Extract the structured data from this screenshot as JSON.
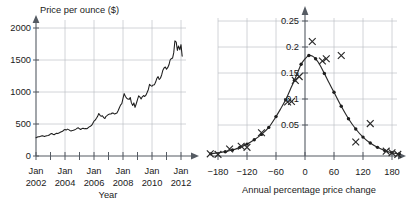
{
  "figure": {
    "panels": [
      "gold-price-time-series",
      "annual-change-distribution"
    ]
  },
  "left_chart": {
    "ylabel": "Price per ounce ($)",
    "xlabel": "Year",
    "y_ticks": [
      "0",
      "500",
      "1000",
      "1500",
      "2000"
    ],
    "x_ticks": [
      "Jan\n2002",
      "Jan\n2004",
      "Jan\n2006",
      "Jan\n2008",
      "Jan\n2010",
      "Jan\n2012"
    ],
    "x_tick_month": "Jan",
    "x_tick_years": [
      "2002",
      "2004",
      "2006",
      "2008",
      "2010",
      "2012"
    ]
  },
  "right_chart": {
    "xlabel": "Annual percentage price change",
    "y_ticks": [
      "0.05",
      "0.1",
      "0.15",
      "0.2",
      "0.25"
    ],
    "x_ticks": [
      "−180",
      "−120",
      "−60",
      "0",
      "60",
      "120",
      "180"
    ]
  },
  "chart_data": [
    {
      "type": "line",
      "id": "gold-price-time-series",
      "title": "",
      "xlabel": "Year",
      "ylabel": "Price per ounce ($)",
      "xlim": [
        2002.0,
        2012.25
      ],
      "ylim": [
        0,
        2100
      ],
      "ytick_values": [
        0,
        500,
        1000,
        1500,
        2000
      ],
      "ytick_labels": [
        "0",
        "500",
        "1000",
        "1500",
        "2000"
      ],
      "xtick_values": [
        2002,
        2004,
        2006,
        2008,
        2010,
        2012
      ],
      "xtick_labels": [
        "Jan 2002",
        "Jan 2004",
        "Jan 2006",
        "Jan 2008",
        "Jan 2010",
        "Jan 2012"
      ],
      "minor_xtick_values": [
        2003,
        2005,
        2007,
        2009,
        2011
      ],
      "grid": "both-major",
      "legend": "none",
      "series": [
        {
          "name": "Gold price per ounce (USD)",
          "x": [
            2002.0,
            2002.08,
            2002.17,
            2002.25,
            2002.33,
            2002.42,
            2002.5,
            2002.58,
            2002.67,
            2002.75,
            2002.83,
            2002.92,
            2003.0,
            2003.08,
            2003.17,
            2003.25,
            2003.33,
            2003.42,
            2003.5,
            2003.58,
            2003.67,
            2003.75,
            2003.83,
            2003.92,
            2004.0,
            2004.08,
            2004.17,
            2004.25,
            2004.33,
            2004.42,
            2004.5,
            2004.58,
            2004.67,
            2004.75,
            2004.83,
            2004.92,
            2005.0,
            2005.08,
            2005.17,
            2005.25,
            2005.33,
            2005.42,
            2005.5,
            2005.58,
            2005.67,
            2005.75,
            2005.83,
            2005.92,
            2006.0,
            2006.08,
            2006.17,
            2006.25,
            2006.33,
            2006.42,
            2006.5,
            2006.58,
            2006.67,
            2006.75,
            2006.83,
            2006.92,
            2007.0,
            2007.08,
            2007.17,
            2007.25,
            2007.33,
            2007.42,
            2007.5,
            2007.58,
            2007.67,
            2007.75,
            2007.83,
            2007.92,
            2008.0,
            2008.08,
            2008.17,
            2008.25,
            2008.33,
            2008.42,
            2008.5,
            2008.58,
            2008.67,
            2008.75,
            2008.83,
            2008.92,
            2009.0,
            2009.08,
            2009.17,
            2009.25,
            2009.33,
            2009.42,
            2009.5,
            2009.58,
            2009.67,
            2009.75,
            2009.83,
            2009.92,
            2010.0,
            2010.08,
            2010.17,
            2010.25,
            2010.33,
            2010.42,
            2010.5,
            2010.58,
            2010.67,
            2010.75,
            2010.83,
            2010.92,
            2011.0,
            2011.08,
            2011.17,
            2011.25,
            2011.33,
            2011.42,
            2011.5,
            2011.58,
            2011.67,
            2011.75,
            2011.83,
            2011.92,
            2012.0,
            2012.08
          ],
          "y": [
            285,
            295,
            300,
            303,
            310,
            318,
            312,
            305,
            312,
            318,
            320,
            328,
            345,
            352,
            340,
            332,
            345,
            355,
            350,
            358,
            370,
            378,
            385,
            405,
            415,
            405,
            420,
            412,
            400,
            392,
            398,
            402,
            410,
            420,
            432,
            440,
            425,
            415,
            428,
            432,
            425,
            430,
            425,
            438,
            455,
            465,
            478,
            510,
            545,
            560,
            590,
            620,
            665,
            635,
            620,
            630,
            600,
            585,
            620,
            635,
            650,
            655,
            655,
            672,
            670,
            655,
            665,
            672,
            710,
            755,
            795,
            820,
            900,
            975,
            930,
            905,
            890,
            885,
            915,
            830,
            790,
            830,
            760,
            820,
            880,
            940,
            920,
            890,
            925,
            945,
            930,
            950,
            995,
            1040,
            1120,
            1100,
            1090,
            1110,
            1115,
            1155,
            1210,
            1240,
            1195,
            1215,
            1270,
            1340,
            1375,
            1390,
            1355,
            1380,
            1425,
            1500,
            1520,
            1530,
            1615,
            1800,
            1780,
            1650,
            1720,
            1660,
            1740,
            1560
          ],
          "marker": "none",
          "color": "#1d1d1d"
        }
      ]
    },
    {
      "type": "scatter",
      "id": "annual-change-distribution",
      "title": "",
      "xlabel": "Annual percentage price change",
      "ylabel": "",
      "xlim": [
        -210,
        210
      ],
      "ylim": [
        0,
        0.275
      ],
      "ytick_values": [
        0.05,
        0.1,
        0.15,
        0.2,
        0.25
      ],
      "ytick_labels": [
        "0.05",
        "0.1",
        "0.15",
        "0.2",
        "0.25"
      ],
      "xtick_values": [
        -180,
        -120,
        -60,
        0,
        60,
        120,
        180
      ],
      "xtick_labels": [
        "−180",
        "−120",
        "−60",
        "0",
        "60",
        "120",
        "180"
      ],
      "grid": "both-major",
      "legend": "none",
      "series": [
        {
          "name": "Fitted normal density curve (with plotted points)",
          "marker": "dot",
          "color": "#1d1d1d",
          "x": [
            -195,
            -165,
            -150,
            -135,
            -120,
            -105,
            -90,
            -75,
            -60,
            -50,
            -40,
            -30,
            -22,
            -15,
            -8,
            0,
            8,
            15,
            22,
            30,
            40,
            50,
            60,
            75,
            90,
            105,
            120,
            135,
            150,
            165,
            180,
            195
          ],
          "y": [
            0.004,
            0.008,
            0.011,
            0.016,
            0.022,
            0.03,
            0.04,
            0.053,
            0.073,
            0.088,
            0.104,
            0.124,
            0.14,
            0.155,
            0.17,
            0.18,
            0.186,
            0.185,
            0.18,
            0.17,
            0.153,
            0.135,
            0.118,
            0.092,
            0.069,
            0.05,
            0.035,
            0.024,
            0.016,
            0.01,
            0.006,
            0.004
          ]
        },
        {
          "name": "Observed data points",
          "marker": "x-cross",
          "color": "#2a2a2a",
          "x": [
            -196,
            -180,
            -156,
            -132,
            -120,
            -90,
            -36,
            -28,
            -20,
            -12,
            15,
            36,
            44,
            75,
            105,
            135,
            168,
            180,
            192
          ],
          "y": [
            0.004,
            0.003,
            0.013,
            0.018,
            0.016,
            0.043,
            0.1,
            0.101,
            0.14,
            0.147,
            0.212,
            0.176,
            0.18,
            0.186,
            0.026,
            0.06,
            0.009,
            0.006,
            0.003
          ]
        }
      ]
    }
  ]
}
